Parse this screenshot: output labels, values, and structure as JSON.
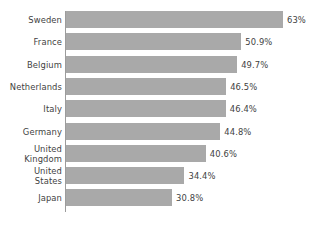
{
  "chart_data": {
    "type": "bar",
    "orientation": "horizontal",
    "title": "",
    "subtitle": "",
    "xlabel": "",
    "ylabel": "",
    "grid": false,
    "legend": false,
    "axis_ticks_visible": false,
    "xlim": [
      0,
      63
    ],
    "categories": [
      "Sweden",
      "France",
      "Belgium",
      "Netherlands",
      "Italy",
      "Germany",
      "United Kingdom",
      "United States",
      "Japan"
    ],
    "category_lines": [
      [
        "Sweden"
      ],
      [
        "France"
      ],
      [
        "Belgium"
      ],
      [
        "Netherlands"
      ],
      [
        "Italy"
      ],
      [
        "Germany"
      ],
      [
        "United",
        "Kingdom"
      ],
      [
        "United",
        "States"
      ],
      [
        "Japan"
      ]
    ],
    "values": [
      63,
      50.9,
      49.7,
      46.5,
      46.4,
      44.8,
      40.6,
      34.4,
      30.8
    ],
    "value_labels": [
      "63%",
      "50.9%",
      "49.7%",
      "46.5%",
      "46.4%",
      "44.8%",
      "40.6%",
      "34.4%",
      "30.8%"
    ],
    "colors": {
      "bar": "#a9a9a9",
      "axis": "#9c9c9c",
      "text": "#3f3f3f",
      "background": "#ffffff"
    }
  }
}
